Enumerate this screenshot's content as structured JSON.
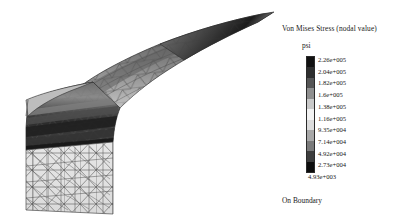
{
  "legend": {
    "title": "Von Mises Stress (nodal value)",
    "unit": "psi",
    "footer": "On Boundary",
    "ticks": [
      "2.26e+005",
      "2.04e+005",
      "1.82e+005",
      "1.6e+005",
      "1.38e+005",
      "1.16e+005",
      "9.35e+004",
      "7.14e+004",
      "4.92e+004",
      "2.73e+004",
      "4.93e+003"
    ],
    "colorbar_colors": [
      "#111111",
      "#2e2e2e",
      "#555555",
      "#8f8f8f",
      "#c9c9c9",
      "#f2f2f2",
      "#dcdcdc",
      "#a8a8a8",
      "#7a7a7a",
      "#3d3d3d",
      "#0d0d0d"
    ]
  },
  "model": {
    "name": "von-mises-stress-contour-mesh",
    "description": "Finite element triangular mesh of a curved cantilever blade shaded by Von Mises stress bands"
  },
  "chart_data": {
    "type": "heatmap",
    "title": "Von Mises Stress (nodal value)",
    "xlabel": "",
    "ylabel": "",
    "colorbar_unit": "psi",
    "colorbar_label": "Von Mises Stress (nodal value)",
    "annotation": "On Boundary",
    "levels": [
      226000,
      204000,
      182000,
      160000,
      138000,
      116000,
      93500,
      71400,
      49200,
      27300,
      4930
    ],
    "level_labels": [
      "2.26e+005",
      "2.04e+005",
      "1.82e+005",
      "1.6e+005",
      "1.38e+005",
      "1.16e+005",
      "9.35e+004",
      "7.14e+004",
      "4.92e+004",
      "2.73e+004",
      "4.93e+003"
    ],
    "value_min": 4930,
    "value_max": 226000,
    "colormap": "grayscale-banded",
    "legend_position": "right",
    "grid": false
  }
}
